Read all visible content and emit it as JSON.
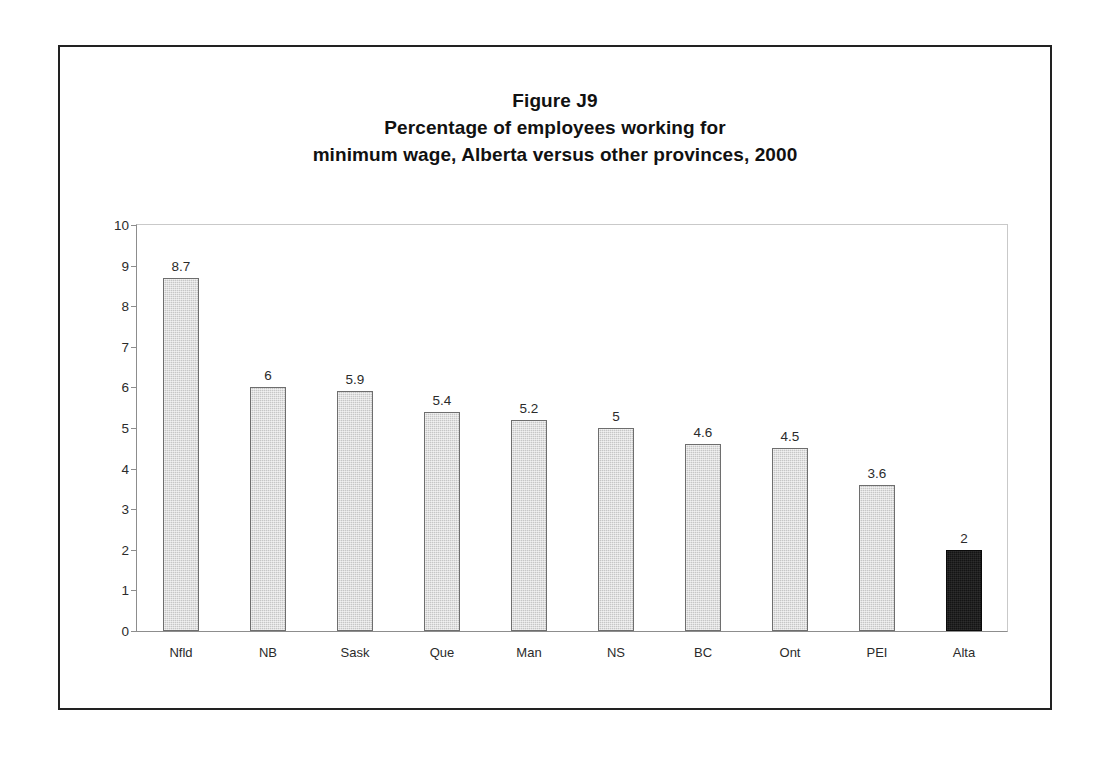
{
  "figure": {
    "title_lines": [
      "Figure J9",
      "Percentage of employees working for",
      "minimum wage, Alberta versus other provinces, 2000"
    ]
  },
  "chart_data": {
    "type": "bar",
    "subtitle": "",
    "xlabel": "",
    "ylabel": "",
    "ylim": [
      0,
      10
    ],
    "ytick_step": 1,
    "yticks": [
      "10",
      "9",
      "8",
      "7",
      "6",
      "5",
      "4",
      "3",
      "2",
      "1",
      "0"
    ],
    "grid": false,
    "legend": null,
    "categories": [
      "Nfld",
      "NB",
      "Sask",
      "Que",
      "Man",
      "NS",
      "BC",
      "Ont",
      "PEI",
      "Alta"
    ],
    "values": [
      8.7,
      6,
      5.9,
      5.4,
      5.2,
      5,
      4.6,
      4.5,
      3.6,
      2
    ],
    "value_labels": [
      "8.7",
      "6",
      "5.9",
      "5.4",
      "5.2",
      "5",
      "4.6",
      "4.5",
      "3.6",
      "2"
    ],
    "highlight_category": "Alta",
    "colors": {
      "bar_fill": "#c6c6c6",
      "bar_border": "#6e6e6e",
      "highlight_fill": "#141414",
      "axis": "#8d8d8d",
      "frame": "#222222",
      "text": "#2b2b2b",
      "background": "#ffffff"
    }
  }
}
